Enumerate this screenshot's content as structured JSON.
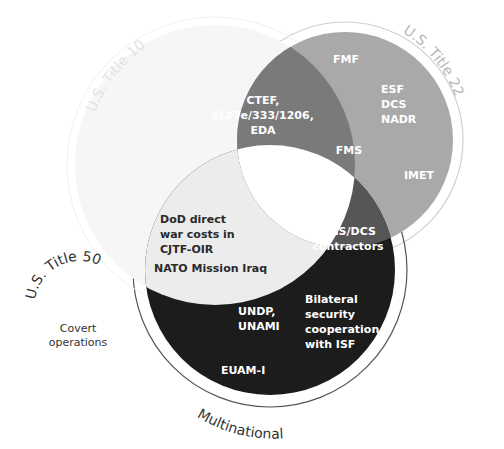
{
  "diagram": {
    "type": "venn",
    "sets": [
      {
        "id": "title10",
        "label": "U.S. Title 10",
        "color": "#f6f6f6"
      },
      {
        "id": "title22",
        "label": "U.S. Title 22",
        "color": "#a9a9a9"
      },
      {
        "id": "multinational",
        "label": "Multinational",
        "color": "#1c1c1c"
      }
    ],
    "external_set": {
      "label": "U.S. Title 50",
      "items": [
        "Covert",
        "operations"
      ]
    },
    "regions": {
      "title22_only": {
        "items": [
          "FMF",
          "ESF",
          "DCS",
          "NADR",
          "IMET"
        ]
      },
      "title10_title22": {
        "lines": [
          "CTEF,",
          "§127e/333/1206,",
          "EDA"
        ],
        "color": "#7a7a7a"
      },
      "title22_center_edge": {
        "items": [
          "FMS"
        ]
      },
      "title22_multinational": {
        "lines": [
          "FMS/DCS",
          "contractors"
        ],
        "color": "#565656"
      },
      "title10_multinational": {
        "lines": [
          "DoD direct",
          "war costs in",
          "CJTF-OIR"
        ],
        "color": "#ececec"
      },
      "title10_multinational_border": {
        "items": [
          "NATO Mission Iraq"
        ]
      },
      "multinational_only": {
        "left_lines": [
          "UNDP,",
          "UNAMI"
        ],
        "right_lines": [
          "Bilateral",
          "security",
          "cooperation",
          "with ISF"
        ],
        "bottom": "EUAM-I"
      },
      "all_three": {
        "color": "#ffffff"
      }
    },
    "colors": {
      "title10_label": "#e6e6e6",
      "title22_label": "#b5b5b5",
      "multinational_label": "#333333",
      "ring": "#c8c8c8",
      "ring_dark": "#555555",
      "white_text": "#ffffff"
    }
  }
}
